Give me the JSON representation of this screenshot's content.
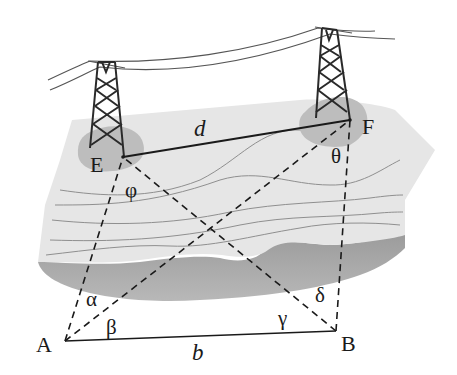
{
  "diagram": {
    "type": "surveying-triangulation",
    "points": {
      "E": {
        "label": "E",
        "x": 123,
        "y": 157
      },
      "F": {
        "label": "F",
        "x": 350,
        "y": 120
      },
      "A": {
        "label": "A",
        "x": 65,
        "y": 341
      },
      "B": {
        "label": "B",
        "x": 336,
        "y": 331
      }
    },
    "segments": {
      "EF": {
        "label": "d",
        "style": "solid"
      },
      "AB": {
        "label": "b",
        "style": "solid"
      },
      "AE": {
        "style": "dashed"
      },
      "AF": {
        "style": "dashed"
      },
      "BE": {
        "style": "dashed"
      },
      "BF": {
        "style": "dashed"
      }
    },
    "angles": {
      "alpha": "α",
      "beta": "β",
      "gamma": "γ",
      "delta": "δ",
      "phi": "φ",
      "theta": "θ"
    },
    "colors": {
      "terrain_top": "#e4e4e4",
      "terrain_side": "#a8a8a8",
      "tower_base": "#bdbdbd",
      "contour": "#8f8f8f",
      "line": "#1a1a1a",
      "wire": "#555555"
    }
  }
}
